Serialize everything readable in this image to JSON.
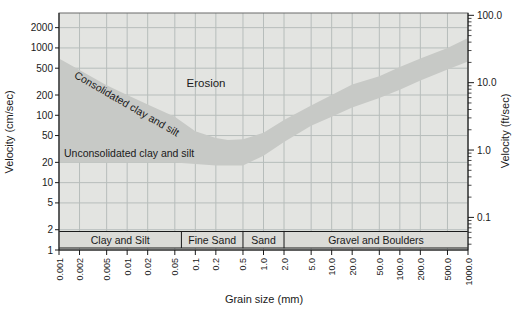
{
  "figure": {
    "background": "#ffffff",
    "plot_bg": "#e3e4e1",
    "band_color": "#c7c9c6",
    "grid_color": "#b7bdbb",
    "strip_bg": "#dbdbd7",
    "axis_color": "#1a1a1a",
    "frame_color": "#6a6a6a"
  },
  "chart_data": {
    "type": "area",
    "title": "",
    "xlabel": "Grain size (mm)",
    "ylabel_left": "Velocity (cm/sec)",
    "ylabel_right": "Velocity (ft/sec)",
    "x_scale": "log",
    "y_scale": "log",
    "xlim": [
      0.001,
      1000
    ],
    "ylim_cm_per_sec": [
      1,
      3300
    ],
    "ft_to_cm": 30.48,
    "grid": true,
    "x_ticks": [
      0.001,
      0.002,
      0.005,
      0.01,
      0.02,
      0.05,
      0.1,
      0.2,
      0.5,
      1.0,
      2.0,
      5.0,
      10.0,
      20.0,
      50.0,
      100.0,
      200.0,
      500.0,
      1000.0
    ],
    "x_tick_labels": [
      "0.001",
      "0.002",
      "0.005",
      "0.01",
      "0.02",
      "0.05",
      "0.1",
      "0.2",
      "0.5",
      "1.0",
      "2.0",
      "5.0",
      "10.0",
      "20.0",
      "50.0",
      "100.0",
      "200.0",
      "500.0",
      "1000.0"
    ],
    "y_ticks_left": [
      1,
      2,
      5,
      10,
      20,
      50,
      100,
      200,
      500,
      1000,
      2000
    ],
    "y_tick_labels_left": [
      "1",
      "2",
      "5",
      "10",
      "20",
      "50",
      "100",
      "200",
      "500",
      "1000",
      "2000"
    ],
    "y_ticks_right_ft": [
      0.1,
      1.0,
      10.0,
      100.0
    ],
    "y_tick_labels_right": [
      "0.1",
      "1.0",
      "10.0",
      "100.0"
    ],
    "band": {
      "name": "Critical erosion velocity band",
      "x_mm": [
        0.001,
        0.002,
        0.005,
        0.01,
        0.02,
        0.05,
        0.1,
        0.2,
        0.3,
        0.5,
        1,
        2,
        5,
        10,
        20,
        50,
        100,
        200,
        500,
        1000
      ],
      "upper_cm_per_sec": [
        700,
        470,
        280,
        200,
        145,
        95,
        58,
        46,
        43,
        44,
        55,
        85,
        140,
        200,
        285,
        380,
        520,
        700,
        1000,
        1400
      ],
      "lower_cm_per_sec": [
        20,
        20,
        20,
        20,
        20,
        20,
        19,
        18,
        18,
        18,
        25,
        40,
        70,
        95,
        130,
        180,
        240,
        330,
        480,
        630
      ]
    },
    "zones": [
      {
        "label": "Erosion",
        "x_mm": 0.15,
        "v_cm_per_sec": 270,
        "rotate": 0
      },
      {
        "label": "Consolidated clay and silt",
        "x_mm": 0.0085,
        "v_cm_per_sec": 125,
        "rotate": 30
      },
      {
        "label": "Unconsolidated clay and silt",
        "x_mm": 0.0012,
        "v_cm_per_sec": 24,
        "rotate": 0
      }
    ],
    "grain_size_classes": [
      {
        "label": "Clay and Silt",
        "from_mm": 0.001,
        "to_mm": 0.0625
      },
      {
        "label": "Fine Sand",
        "from_mm": 0.0625,
        "to_mm": 0.5
      },
      {
        "label": "Sand",
        "from_mm": 0.5,
        "to_mm": 2.0
      },
      {
        "label": "Gravel and Boulders",
        "from_mm": 2.0,
        "to_mm": 1000
      }
    ]
  }
}
